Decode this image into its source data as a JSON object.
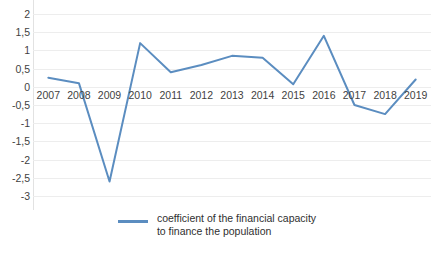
{
  "chart_data": {
    "type": "line",
    "title": "",
    "subtitle": "",
    "xlabel": "",
    "ylabel": "",
    "categories": [
      "2007",
      "2008",
      "2009",
      "2010",
      "2011",
      "2012",
      "2013",
      "2014",
      "2015",
      "2016",
      "2017",
      "2018",
      "2019"
    ],
    "series": [
      {
        "name": "coefficient of the financial capacity to finance the population",
        "color": "#5B8DC0",
        "values": [
          0.25,
          0.1,
          -2.6,
          1.2,
          0.4,
          0.6,
          0.85,
          0.8,
          0.07,
          1.4,
          -0.5,
          -0.75,
          0.2
        ]
      }
    ],
    "ylim": [
      -3,
      2
    ],
    "ytick_step": 0.5,
    "ytick_labels": [
      "2",
      "1,5",
      "1",
      "0,5",
      "0",
      "-0,5",
      "-1",
      "-1,5",
      "-2",
      "-2,5",
      "-3"
    ],
    "ytick_values": [
      2,
      1.5,
      1,
      0.5,
      0,
      -0.5,
      -1,
      -1.5,
      -2,
      -2.5,
      -3
    ],
    "grid": true,
    "grid_color": "#EDEDED",
    "legend_position": "bottom",
    "legend": [
      {
        "label_line1": "coefficient of the financial capacity",
        "label_line2": "to finance the population",
        "color": "#5B8DC0"
      }
    ],
    "background": "#FFFFFF",
    "decimal_separator": ","
  }
}
